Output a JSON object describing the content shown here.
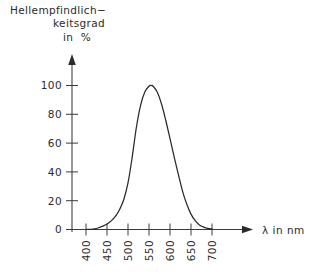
{
  "figure": {
    "title_lines": [
      "Hellempfindlich−",
      "keitsgrad",
      "in  %"
    ],
    "y_axis": {
      "caption": "",
      "tick_labels": [
        "0",
        "20",
        "40",
        "60",
        "80",
        "100"
      ],
      "tick_values": [
        0,
        20,
        40,
        60,
        80,
        100
      ],
      "unit": "%"
    },
    "x_axis": {
      "caption": "λ in nm",
      "tick_labels": [
        "400",
        "450",
        "500",
        "550",
        "600",
        "650",
        "700"
      ],
      "tick_values": [
        400,
        450,
        500,
        550,
        600,
        650,
        700
      ],
      "unit": "nm"
    },
    "colors": {
      "ink": "#2a2a2a",
      "axis": "#3a3a3a",
      "background": "#ffffff"
    }
  },
  "chart_data": {
    "type": "line",
    "xlabel": "λ in nm",
    "ylabel": "Hellempfindlichkeitsgrad in %",
    "xlim": [
      400,
      700
    ],
    "ylim": [
      0,
      110
    ],
    "grid": false,
    "legend": null,
    "xticks": [
      400,
      450,
      500,
      550,
      600,
      650,
      700
    ],
    "yticks": [
      0,
      20,
      40,
      60,
      80,
      100
    ],
    "series": [
      {
        "name": "Hellempfindlichkeitsgrad V(λ)",
        "x": [
          400,
          410,
          420,
          430,
          440,
          450,
          460,
          470,
          480,
          490,
          500,
          510,
          520,
          530,
          540,
          550,
          555,
          560,
          570,
          580,
          590,
          600,
          610,
          620,
          630,
          640,
          650,
          660,
          670,
          680,
          690,
          700
        ],
        "values": [
          0.0,
          0.1,
          0.4,
          1.2,
          2.3,
          3.8,
          6.0,
          9.1,
          13.9,
          20.8,
          32.3,
          50.3,
          71.0,
          86.2,
          95.4,
          99.5,
          100.0,
          99.5,
          95.2,
          87.0,
          75.7,
          63.1,
          50.3,
          38.1,
          26.5,
          17.5,
          10.7,
          6.1,
          3.2,
          1.7,
          0.8,
          0.4
        ]
      }
    ]
  }
}
